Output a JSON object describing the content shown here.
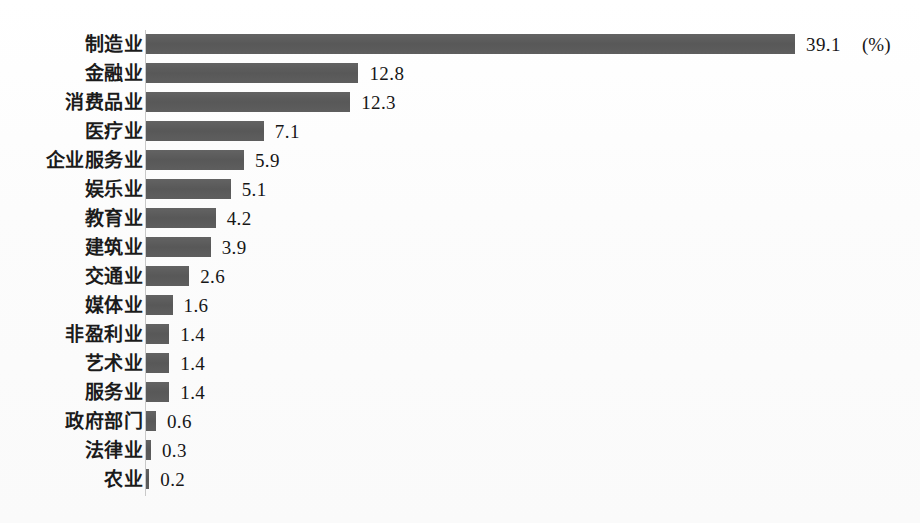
{
  "chart_data": {
    "type": "bar",
    "orientation": "horizontal",
    "title": "",
    "subtitle": "",
    "xlabel": "",
    "ylabel": "",
    "unit_note": "(%)",
    "grid": false,
    "legend": null,
    "axis": {
      "min": 0,
      "max": 39.1,
      "ticks_visible": false
    },
    "categories": [
      "制造业",
      "金融业",
      "消费品业",
      "医疗业",
      "企业服务业",
      "娱乐业",
      "教育业",
      "建筑业",
      "交通业",
      "媒体业",
      "非盈利业",
      "艺术业",
      "服务业",
      "政府部门",
      "法律业",
      "农业"
    ],
    "values": [
      39.1,
      12.8,
      12.3,
      7.1,
      5.9,
      5.1,
      4.2,
      3.9,
      2.6,
      1.6,
      1.4,
      1.4,
      1.4,
      0.6,
      0.3,
      0.2
    ],
    "value_labels": [
      "39.1",
      "12.8",
      "12.3",
      "7.1",
      "5.9",
      "5.1",
      "4.2",
      "3.9",
      "2.6",
      "1.6",
      "1.4",
      "1.4",
      "1.4",
      "0.6",
      "0.3",
      "0.2"
    ],
    "bar_color": "#5b5b5b",
    "background_color": "#fdfdfd",
    "text_color": "#1b1b1b"
  }
}
